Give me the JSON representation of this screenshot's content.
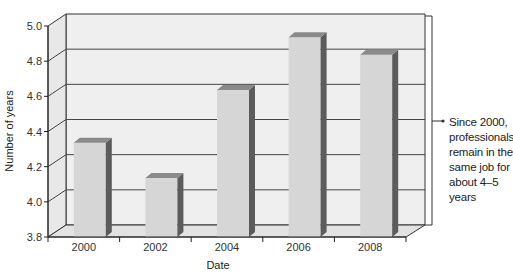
{
  "chart_data": {
    "type": "bar",
    "style": "3d",
    "title": "",
    "categories": [
      "2000",
      "2002",
      "2004",
      "2006",
      "2008"
    ],
    "values": [
      4.37,
      4.17,
      4.67,
      4.97,
      4.87
    ],
    "xlabel": "Date",
    "ylabel": "Number of years",
    "ylim": [
      3.8,
      5.0
    ],
    "yticks": [
      "3.8",
      "4.0",
      "4.2",
      "4.4",
      "4.6",
      "4.8",
      "5.0"
    ],
    "grid": true,
    "legend": null,
    "annotation": {
      "text": "Since 2000, professionals remain in the same job for about 4–5 years",
      "lines": [
        "Since 2000,",
        "professionals",
        "remain in the",
        "same job for",
        "about 4–5",
        "years"
      ],
      "position": "right",
      "bracket_range": [
        3.8,
        5.0
      ]
    }
  },
  "colors": {
    "bar_front": "#d6d6d6",
    "bar_side": "#5c5c5c",
    "bar_top": "#8a8a8a",
    "wall": "#efefef",
    "floor": "#e2e2e2",
    "gridline": "#444444"
  }
}
